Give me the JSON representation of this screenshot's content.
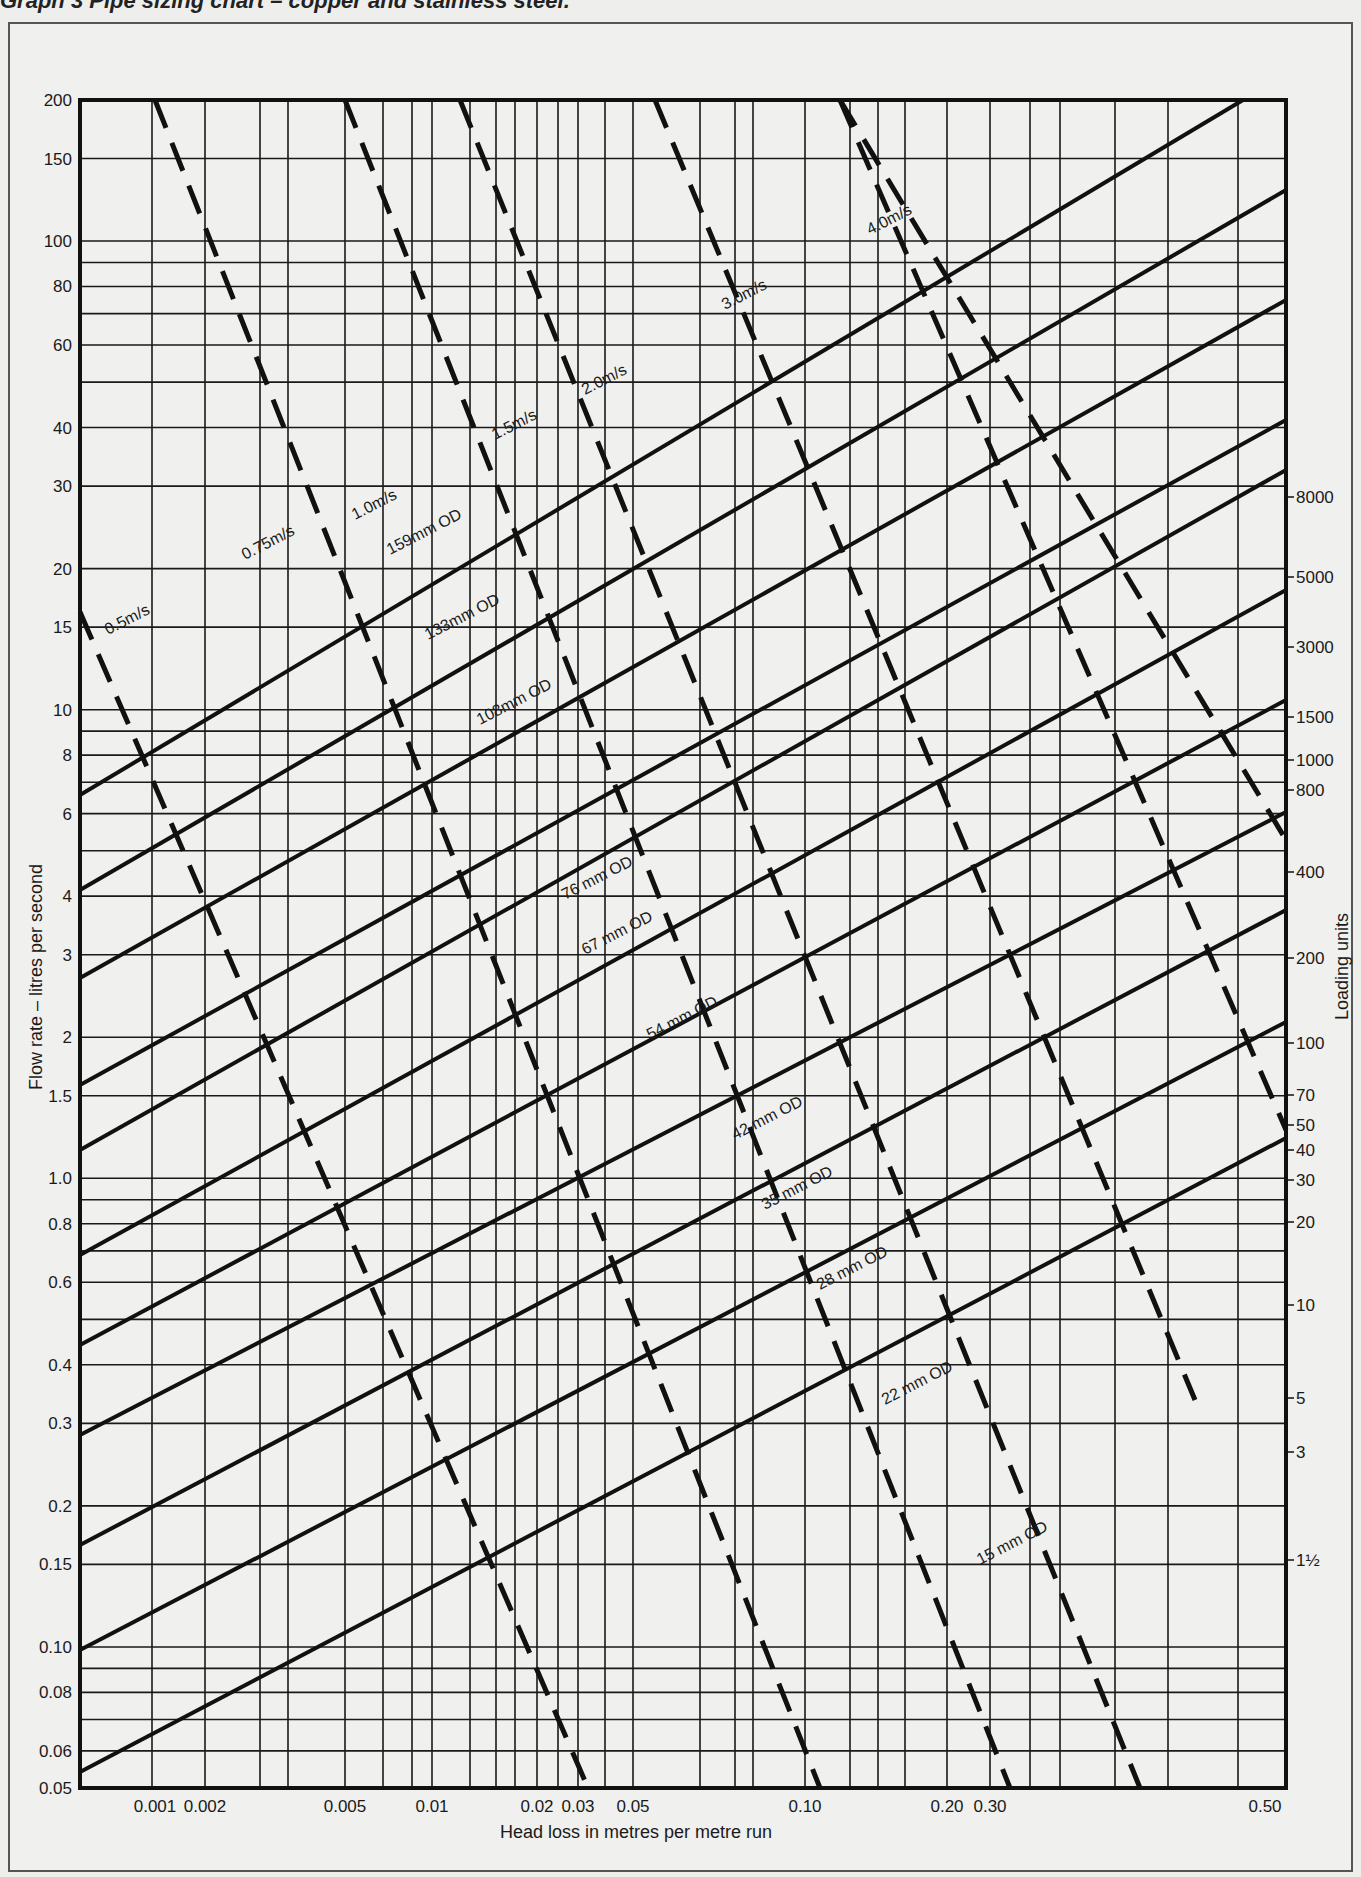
{
  "caption": "Graph 3  Pipe sizing chart – copper and stainless steel.",
  "chart_data": {
    "type": "line",
    "title": "Pipe sizing chart – copper and stainless steel",
    "xlabel": "Head loss in metres per metre run",
    "ylabel": "Flow rate – litres per second",
    "y2label": "Loading units",
    "xscale": "log",
    "yscale": "log",
    "xlim": [
      0.0005,
      0.5
    ],
    "ylim": [
      0.05,
      200
    ],
    "grid": true,
    "x_ticks": [
      "0.001",
      "0.002",
      "0.005",
      "0.01",
      "0.02",
      "0.03",
      "0.05",
      "0.10",
      "0.20",
      "0.30",
      "0.50"
    ],
    "y_ticks": [
      "200",
      "150",
      "100",
      "80",
      "60",
      "40",
      "30",
      "20",
      "15",
      "10",
      "8",
      "6",
      "4",
      "3",
      "2",
      "1.5",
      "1.0",
      "0.8",
      "0.6",
      "0.4",
      "0.3",
      "0.2",
      "0.15",
      "0.10",
      "0.08",
      "0.06",
      "0.05"
    ],
    "y2_ticks": [
      "8000",
      "5000",
      "3000",
      "1500",
      "1000",
      "800",
      "400",
      "200",
      "100",
      "70",
      "50",
      "40",
      "30",
      "20",
      "10",
      "5",
      "3",
      "1½"
    ],
    "pipe_series": [
      {
        "name": "159 mm OD",
        "style": "solid",
        "label": "159mm OD"
      },
      {
        "name": "133 mm OD",
        "style": "solid",
        "label": "133mm OD"
      },
      {
        "name": "108 mm OD",
        "style": "solid",
        "label": "108mm OD"
      },
      {
        "name": "76 mm OD",
        "style": "solid",
        "label": "76 mm OD"
      },
      {
        "name": "67 mm OD",
        "style": "solid",
        "label": "67 mm OD"
      },
      {
        "name": "54 mm OD",
        "style": "solid",
        "label": "54 mm OD"
      },
      {
        "name": "42 mm OD",
        "style": "solid",
        "label": "42 mm OD"
      },
      {
        "name": "35 mm OD",
        "style": "solid",
        "label": "35 mm OD"
      },
      {
        "name": "28 mm OD",
        "style": "solid",
        "label": "28 mm OD"
      },
      {
        "name": "22 mm OD",
        "style": "solid",
        "label": "22 mm OD"
      },
      {
        "name": "15 mm OD",
        "style": "solid",
        "label": "15 mm OD"
      }
    ],
    "velocity_series": [
      {
        "name": "0.5 m/s",
        "style": "dashed",
        "label": "0.5m/s"
      },
      {
        "name": "0.75 m/s",
        "style": "dashed",
        "label": "0.75m/s"
      },
      {
        "name": "1.0 m/s",
        "style": "dashed",
        "label": "1.0m/s"
      },
      {
        "name": "1.5 m/s",
        "style": "dashed",
        "label": "1.5m/s"
      },
      {
        "name": "2.0 m/s",
        "style": "dashed",
        "label": "2.0m/s"
      },
      {
        "name": "3.0 m/s",
        "style": "dashed",
        "label": "3.0m/s"
      },
      {
        "name": "4.0 m/s",
        "style": "dashed",
        "label": "4.0m/s"
      }
    ]
  }
}
